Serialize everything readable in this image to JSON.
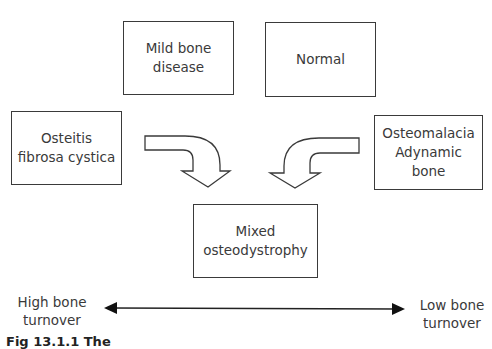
{
  "diagram": {
    "boxes": {
      "mild": "Mild bone\ndisease",
      "normal": "Normal",
      "osteitis": "Osteitis\nfibrosa cystica",
      "osteomalacia": "Osteomalacia\nAdynamic\nbone",
      "mixed": "Mixed\nosteodystrophy"
    },
    "axis": {
      "left_label": "High bone\nturnover",
      "right_label": "Low bone\nturnover"
    },
    "caption": "Fig 13.1.1  The"
  },
  "colors": {
    "stroke": "#3a3a3a",
    "background": "#ffffff"
  }
}
